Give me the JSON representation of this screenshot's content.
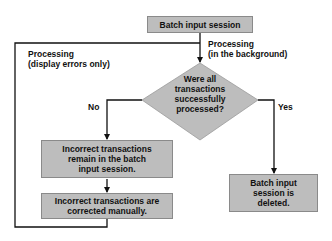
{
  "diagram": {
    "start": {
      "label": "Batch input session"
    },
    "edges": {
      "background": "Processing\n(in the background)",
      "display_errors": "Processing\n(display errors only)",
      "no": "No",
      "yes": "Yes"
    },
    "decision": {
      "label": "Were all\ntransactions\nsuccessfully\nprocessed?"
    },
    "no_branch": {
      "step1": "Incorrect transactions\nremain in the batch\ninput session.",
      "step2": "Incorrect transactions are\ncorrected manually."
    },
    "yes_branch": {
      "step1": "Batch input\nsession is\ndeleted."
    },
    "colors": {
      "box_fill": "#bdbdbd",
      "box_border": "#8a8a8a",
      "line": "#111111"
    }
  }
}
